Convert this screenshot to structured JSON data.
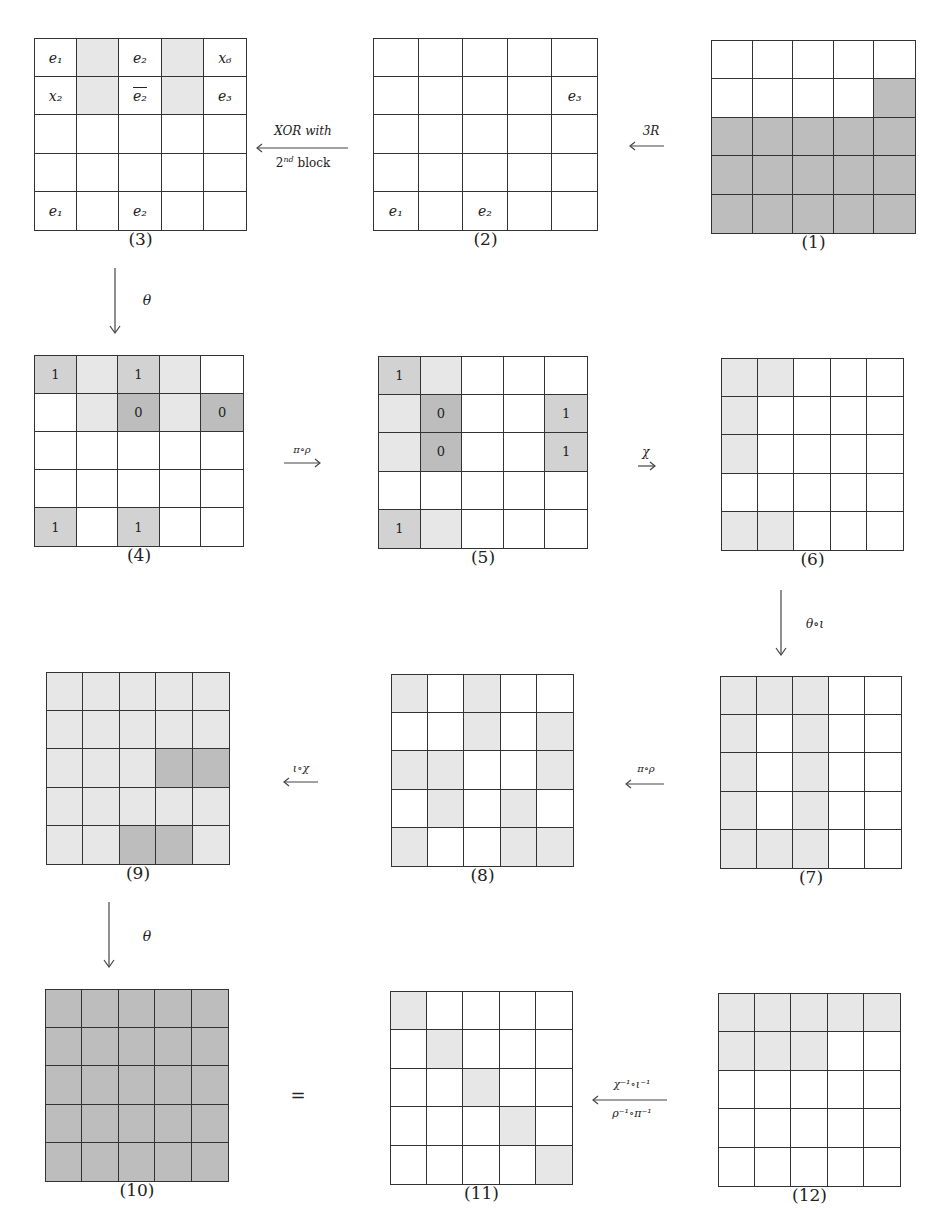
{
  "colors": {
    "white": "#ffffff",
    "light": "#e7e7e7",
    "medium": "#d2d2d2",
    "dark": "#bdbdbd",
    "line": "#333333"
  },
  "grids": [
    {
      "id": "1",
      "caption": "(1)",
      "x": 711,
      "y": 40,
      "w": 205,
      "h": 194,
      "cells": [
        [
          "W",
          "W",
          "W",
          "W",
          "W"
        ],
        [
          "W",
          "W",
          "W",
          "W",
          "D"
        ],
        [
          "D",
          "D",
          "D",
          "D",
          "D"
        ],
        [
          "D",
          "D",
          "D",
          "D",
          "D"
        ],
        [
          "D",
          "D",
          "D",
          "D",
          "D"
        ]
      ],
      "labels": [
        [
          "",
          "",
          "",
          "",
          ""
        ],
        [
          "",
          "",
          "",
          "",
          ""
        ],
        [
          "",
          "",
          "",
          "",
          ""
        ],
        [
          "",
          "",
          "",
          "",
          ""
        ],
        [
          "",
          "",
          "",
          "",
          ""
        ]
      ]
    },
    {
      "id": "2",
      "caption": "(2)",
      "x": 373,
      "y": 38,
      "w": 225,
      "h": 193,
      "cells": [
        [
          "W",
          "W",
          "W",
          "W",
          "W"
        ],
        [
          "W",
          "W",
          "W",
          "W",
          "W"
        ],
        [
          "W",
          "W",
          "W",
          "W",
          "W"
        ],
        [
          "W",
          "W",
          "W",
          "W",
          "W"
        ],
        [
          "W",
          "W",
          "W",
          "W",
          "W"
        ]
      ],
      "labels": [
        [
          "",
          "",
          "",
          "",
          ""
        ],
        [
          "",
          "",
          "",
          "",
          "e₃"
        ],
        [
          "",
          "",
          "",
          "",
          ""
        ],
        [
          "",
          "",
          "",
          "",
          ""
        ],
        [
          "e₁",
          "",
          "e₂",
          "",
          ""
        ]
      ]
    },
    {
      "id": "3",
      "caption": "(3)",
      "x": 34,
      "y": 38,
      "w": 213,
      "h": 193,
      "cells": [
        [
          "W",
          "L",
          "W",
          "L",
          "W"
        ],
        [
          "W",
          "L",
          "W",
          "L",
          "W"
        ],
        [
          "W",
          "W",
          "W",
          "W",
          "W"
        ],
        [
          "W",
          "W",
          "W",
          "W",
          "W"
        ],
        [
          "W",
          "W",
          "W",
          "W",
          "W"
        ]
      ],
      "labels": [
        [
          "e₁",
          "",
          "e₂",
          "",
          "x₆"
        ],
        [
          "x₂",
          "",
          "e₂̄",
          "",
          "e₃"
        ],
        [
          "",
          "",
          "",
          "",
          ""
        ],
        [
          "",
          "",
          "",
          "",
          ""
        ],
        [
          "e₁",
          "",
          "e₂",
          "",
          ""
        ]
      ],
      "overline": [
        [
          1,
          2
        ]
      ]
    },
    {
      "id": "4",
      "caption": "(4)",
      "x": 34,
      "y": 355,
      "w": 210,
      "h": 192,
      "cells": [
        [
          "M",
          "L",
          "M",
          "L",
          "W"
        ],
        [
          "W",
          "L",
          "D",
          "L",
          "D"
        ],
        [
          "W",
          "W",
          "W",
          "W",
          "W"
        ],
        [
          "W",
          "W",
          "W",
          "W",
          "W"
        ],
        [
          "M",
          "W",
          "M",
          "W",
          "W"
        ]
      ],
      "labels": [
        [
          "1",
          "",
          "1",
          "",
          ""
        ],
        [
          "",
          "",
          "0",
          "",
          "0"
        ],
        [
          "",
          "",
          "",
          "",
          ""
        ],
        [
          "",
          "",
          "",
          "",
          ""
        ],
        [
          "1",
          "",
          "1",
          "",
          ""
        ]
      ]
    },
    {
      "id": "5",
      "caption": "(5)",
      "x": 378,
      "y": 356,
      "w": 210,
      "h": 193,
      "cells": [
        [
          "M",
          "L",
          "W",
          "W",
          "W"
        ],
        [
          "L",
          "D",
          "W",
          "W",
          "M"
        ],
        [
          "L",
          "D",
          "W",
          "W",
          "M"
        ],
        [
          "W",
          "W",
          "W",
          "W",
          "W"
        ],
        [
          "M",
          "L",
          "W",
          "W",
          "W"
        ]
      ],
      "labels": [
        [
          "1",
          "",
          "",
          "",
          ""
        ],
        [
          "",
          "0",
          "",
          "",
          "1"
        ],
        [
          "",
          "0",
          "",
          "",
          "1"
        ],
        [
          "",
          "",
          "",
          "",
          ""
        ],
        [
          "1",
          "",
          "",
          "",
          ""
        ]
      ]
    },
    {
      "id": "6",
      "caption": "(6)",
      "x": 721,
      "y": 358,
      "w": 183,
      "h": 193,
      "cells": [
        [
          "L",
          "L",
          "W",
          "W",
          "W"
        ],
        [
          "L",
          "W",
          "W",
          "W",
          "W"
        ],
        [
          "L",
          "W",
          "W",
          "W",
          "W"
        ],
        [
          "W",
          "W",
          "W",
          "W",
          "W"
        ],
        [
          "L",
          "L",
          "W",
          "W",
          "W"
        ]
      ],
      "labels": [
        [
          "",
          "",
          "",
          "",
          ""
        ],
        [
          "",
          "",
          "",
          "",
          ""
        ],
        [
          "",
          "",
          "",
          "",
          ""
        ],
        [
          "",
          "",
          "",
          "",
          ""
        ],
        [
          "",
          "",
          "",
          "",
          ""
        ]
      ]
    },
    {
      "id": "7",
      "caption": "(7)",
      "x": 720,
      "y": 676,
      "w": 182,
      "h": 193,
      "cells": [
        [
          "L",
          "L",
          "L",
          "W",
          "W"
        ],
        [
          "L",
          "W",
          "L",
          "W",
          "W"
        ],
        [
          "L",
          "W",
          "L",
          "W",
          "W"
        ],
        [
          "L",
          "W",
          "L",
          "W",
          "W"
        ],
        [
          "L",
          "L",
          "L",
          "W",
          "W"
        ]
      ],
      "labels": [
        [
          "",
          "",
          "",
          "",
          ""
        ],
        [
          "",
          "",
          "",
          "",
          ""
        ],
        [
          "",
          "",
          "",
          "",
          ""
        ],
        [
          "",
          "",
          "",
          "",
          ""
        ],
        [
          "",
          "",
          "",
          "",
          ""
        ]
      ]
    },
    {
      "id": "8",
      "caption": "(8)",
      "x": 391,
      "y": 674,
      "w": 183,
      "h": 193,
      "cells": [
        [
          "L",
          "W",
          "L",
          "W",
          "W"
        ],
        [
          "W",
          "W",
          "L",
          "W",
          "L"
        ],
        [
          "L",
          "L",
          "W",
          "W",
          "L"
        ],
        [
          "W",
          "L",
          "W",
          "L",
          "W"
        ],
        [
          "L",
          "W",
          "W",
          "L",
          "L"
        ]
      ],
      "labels": [
        [
          "",
          "",
          "",
          "",
          ""
        ],
        [
          "",
          "",
          "",
          "",
          ""
        ],
        [
          "",
          "",
          "",
          "",
          ""
        ],
        [
          "",
          "",
          "",
          "",
          ""
        ],
        [
          "",
          "",
          "",
          "",
          ""
        ]
      ]
    },
    {
      "id": "9",
      "caption": "(9)",
      "x": 46,
      "y": 672,
      "w": 184,
      "h": 193,
      "cells": [
        [
          "L",
          "L",
          "L",
          "L",
          "L"
        ],
        [
          "L",
          "L",
          "L",
          "L",
          "L"
        ],
        [
          "L",
          "L",
          "L",
          "D",
          "D"
        ],
        [
          "L",
          "L",
          "L",
          "L",
          "L"
        ],
        [
          "L",
          "L",
          "D",
          "D",
          "L"
        ]
      ],
      "labels": [
        [
          "",
          "",
          "",
          "",
          ""
        ],
        [
          "",
          "",
          "",
          "",
          ""
        ],
        [
          "",
          "",
          "",
          "",
          ""
        ],
        [
          "",
          "",
          "",
          "",
          ""
        ],
        [
          "",
          "",
          "",
          "",
          ""
        ]
      ]
    },
    {
      "id": "10",
      "caption": "(10)",
      "x": 45,
      "y": 989,
      "w": 184,
      "h": 193,
      "cells": [
        [
          "D",
          "D",
          "D",
          "D",
          "D"
        ],
        [
          "D",
          "D",
          "D",
          "D",
          "D"
        ],
        [
          "D",
          "D",
          "D",
          "D",
          "D"
        ],
        [
          "D",
          "D",
          "D",
          "D",
          "D"
        ],
        [
          "D",
          "D",
          "D",
          "D",
          "D"
        ]
      ],
      "labels": [
        [
          "",
          "",
          "",
          "",
          ""
        ],
        [
          "",
          "",
          "",
          "",
          ""
        ],
        [
          "",
          "",
          "",
          "",
          ""
        ],
        [
          "",
          "",
          "",
          "",
          ""
        ],
        [
          "",
          "",
          "",
          "",
          ""
        ]
      ]
    },
    {
      "id": "11",
      "caption": "(11)",
      "x": 390,
      "y": 991,
      "w": 183,
      "h": 194,
      "cells": [
        [
          "L",
          "W",
          "W",
          "W",
          "W"
        ],
        [
          "W",
          "L",
          "W",
          "W",
          "W"
        ],
        [
          "W",
          "W",
          "L",
          "W",
          "W"
        ],
        [
          "W",
          "W",
          "W",
          "L",
          "W"
        ],
        [
          "W",
          "W",
          "W",
          "W",
          "L"
        ]
      ],
      "labels": [
        [
          "",
          "",
          "",
          "",
          ""
        ],
        [
          "",
          "",
          "",
          "",
          ""
        ],
        [
          "",
          "",
          "",
          "",
          ""
        ],
        [
          "",
          "",
          "",
          "",
          ""
        ],
        [
          "",
          "",
          "",
          "",
          ""
        ]
      ]
    },
    {
      "id": "12",
      "caption": "(12)",
      "x": 718,
      "y": 993,
      "w": 183,
      "h": 194,
      "cells": [
        [
          "L",
          "L",
          "L",
          "L",
          "L"
        ],
        [
          "L",
          "L",
          "L",
          "W",
          "W"
        ],
        [
          "W",
          "W",
          "W",
          "W",
          "W"
        ],
        [
          "W",
          "W",
          "W",
          "W",
          "W"
        ],
        [
          "W",
          "W",
          "W",
          "W",
          "W"
        ]
      ],
      "labels": [
        [
          "",
          "",
          "",
          "",
          ""
        ],
        [
          "",
          "",
          "",
          "",
          ""
        ],
        [
          "",
          "",
          "",
          "",
          ""
        ],
        [
          "",
          "",
          "",
          "",
          ""
        ],
        [
          "",
          "",
          "",
          "",
          ""
        ]
      ]
    }
  ],
  "arrows": {
    "a_1_2": {
      "label": "3R"
    },
    "a_2_3": {
      "label_top": "XOR with",
      "label_bottom": "2nd block"
    },
    "a_3_4": {
      "label": "θ"
    },
    "a_4_5": {
      "label": "π∘ρ"
    },
    "a_5_6": {
      "label": "χ"
    },
    "a_6_7": {
      "label": "θ∘ι"
    },
    "a_7_8": {
      "label": "π∘ρ"
    },
    "a_8_9": {
      "label": "ι∘χ"
    },
    "a_9_10": {
      "label": "θ"
    },
    "a_12_11": {
      "label_top": "χ⁻¹∘ι⁻¹",
      "label_bottom": "ρ⁻¹∘π⁻¹"
    }
  },
  "equals": "="
}
